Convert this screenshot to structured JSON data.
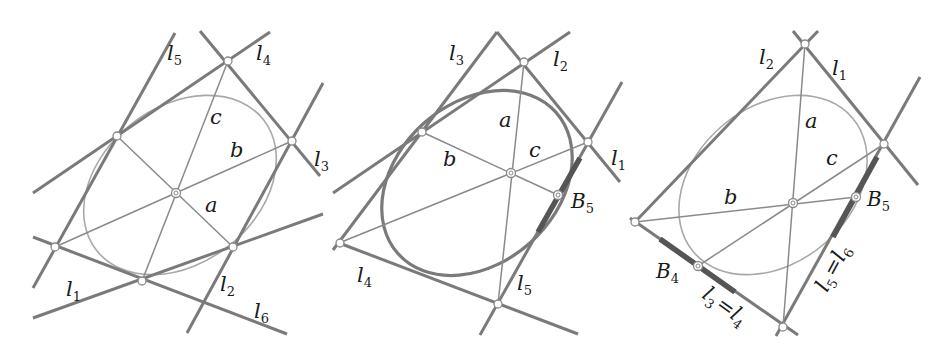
{
  "figure": {
    "colors": {
      "line": "#7a7a7a",
      "diagonal": "#8a8a8a",
      "ellipse": "#a8a8a8",
      "highlight": "#555555",
      "text": "#1a1a1a"
    },
    "panels": [
      {
        "name": "panel-1",
        "tangent_labels": [
          {
            "letter": "l",
            "sub": "5"
          },
          {
            "letter": "l",
            "sub": "4"
          },
          {
            "letter": "l",
            "sub": "3"
          },
          {
            "letter": "l",
            "sub": "2"
          },
          {
            "letter": "l",
            "sub": "1"
          },
          {
            "letter": "l",
            "sub": "6"
          }
        ],
        "diagonal_labels": {
          "a": "a",
          "b": "b",
          "c": "c"
        }
      },
      {
        "name": "panel-2",
        "tangent_labels": [
          {
            "letter": "l",
            "sub": "3"
          },
          {
            "letter": "l",
            "sub": "2"
          },
          {
            "letter": "l",
            "sub": "1"
          },
          {
            "letter": "l",
            "sub": "4"
          },
          {
            "letter": "l",
            "sub": "5"
          }
        ],
        "diagonal_labels": {
          "a": "a",
          "b": "b",
          "c": "c"
        },
        "points": [
          {
            "letter": "B",
            "sub": "5"
          }
        ]
      },
      {
        "name": "panel-3",
        "tangent_labels": [
          {
            "letter": "l",
            "sub": "2"
          },
          {
            "letter": "l",
            "sub": "1"
          }
        ],
        "merged_labels": [
          {
            "left": {
              "letter": "l",
              "sub": "3"
            },
            "eq": "=",
            "right": {
              "letter": "l",
              "sub": "4"
            }
          },
          {
            "left": {
              "letter": "l",
              "sub": "5"
            },
            "eq": "=",
            "right": {
              "letter": "l",
              "sub": "6"
            }
          }
        ],
        "diagonal_labels": {
          "a": "a",
          "b": "b",
          "c": "c"
        },
        "points": [
          {
            "letter": "B",
            "sub": "4"
          },
          {
            "letter": "B",
            "sub": "5"
          }
        ]
      }
    ]
  }
}
